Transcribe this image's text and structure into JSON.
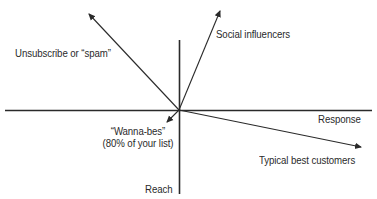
{
  "diagram": {
    "type": "quadrant-vector-diagram",
    "axes": {
      "horizontal": {
        "label": "Response"
      },
      "vertical": {
        "label": "Reach"
      }
    },
    "vectors": [
      {
        "id": "unsubscribe",
        "label": "Unsubscribe or “spam”",
        "direction": "up-left"
      },
      {
        "id": "social-influencers",
        "label": "Social influencers",
        "direction": "up-right"
      },
      {
        "id": "wanna-bes",
        "label_line1": "“Wanna-bes”",
        "label_line2": "(80% of your list)",
        "direction": "down-left"
      },
      {
        "id": "typical-best-customers",
        "label": "Typical best customers",
        "direction": "down-right"
      }
    ],
    "colors": {
      "line": "#2a2a2a",
      "background": "#ffffff",
      "text": "#2a2a2a"
    }
  }
}
